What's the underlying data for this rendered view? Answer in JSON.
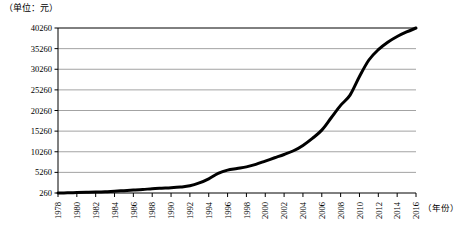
{
  "unit_note": "（单位：元）",
  "axis_title_x": "（年份）",
  "chart_data": {
    "type": "line",
    "title": "",
    "subtitle": "",
    "xlabel": "（年份）",
    "ylabel": "（单位：元）",
    "grid": true,
    "legend": null,
    "xlim": [
      1978,
      2016
    ],
    "ylim": [
      260,
      40260
    ],
    "yticks": [
      260,
      5260,
      10260,
      15260,
      20260,
      25260,
      30260,
      35260,
      40260
    ],
    "ytick_labels": [
      "260",
      "5260",
      "10260",
      "15260",
      "20260",
      "25260",
      "30260",
      "35260",
      "40260"
    ],
    "xticks": [
      1978,
      1980,
      1982,
      1984,
      1986,
      1988,
      1990,
      1992,
      1994,
      1996,
      1998,
      2000,
      2002,
      2004,
      2006,
      2008,
      2010,
      2012,
      2014,
      2016
    ],
    "xtick_labels": [
      "1978",
      "1980",
      "1982",
      "1984",
      "1986",
      "1988",
      "1990",
      "1992",
      "1994",
      "1996",
      "1998",
      "2000",
      "2002",
      "2004",
      "2006",
      "2008",
      "2010",
      "2012",
      "2014",
      "2016"
    ],
    "series": [
      {
        "name": "",
        "color": "#000000",
        "line_width": 3,
        "x": [
          1978,
          1979,
          1980,
          1981,
          1982,
          1983,
          1984,
          1985,
          1986,
          1987,
          1988,
          1989,
          1990,
          1991,
          1992,
          1993,
          1994,
          1995,
          1996,
          1997,
          1998,
          1999,
          2000,
          2001,
          2002,
          2003,
          2004,
          2005,
          2006,
          2007,
          2008,
          2009,
          2010,
          2011,
          2012,
          2013,
          2014,
          2015,
          2016
        ],
        "values": [
          260,
          300,
          360,
          420,
          480,
          560,
          700,
          830,
          960,
          1100,
          1300,
          1420,
          1530,
          1700,
          2000,
          2700,
          3700,
          5000,
          5800,
          6200,
          6600,
          7200,
          8000,
          8800,
          9600,
          10500,
          11800,
          13500,
          15500,
          18500,
          21500,
          24000,
          28500,
          32500,
          35000,
          36800,
          38200,
          39300,
          40260
        ]
      }
    ]
  }
}
